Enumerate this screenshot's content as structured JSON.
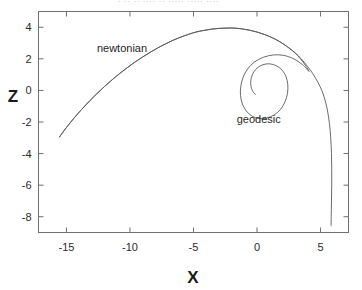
{
  "figure": {
    "top_caption_fragment": "· ·· ·· ···· ·· ····· ····· ····",
    "background_color": "#ffffff",
    "line_color": "#5a5a60",
    "axis_color": "#6f6f74"
  },
  "chart_data": {
    "type": "line",
    "title": "",
    "xlabel": "X",
    "ylabel": "Z",
    "xlim": [
      -17.2,
      7.2
    ],
    "ylim": [
      -9.0,
      5.0
    ],
    "grid": false,
    "legend": "none",
    "xticks": [
      -15,
      -10,
      -5,
      0,
      5
    ],
    "xticklabels": [
      "-15",
      "-10",
      "-5",
      "0",
      "5"
    ],
    "yticks": [
      4,
      2,
      0,
      -2,
      -4,
      -6,
      -8
    ],
    "yticklabels": [
      "4",
      "2",
      "0",
      "-2",
      "-4",
      "-6",
      "-8"
    ],
    "annotations": [
      {
        "text": "newtonian",
        "x": -12.6,
        "y": 2.45
      },
      {
        "text": "geodesic",
        "x": -1.6,
        "y": -2.05
      }
    ],
    "series": [
      {
        "name": "newtonian",
        "label": "newtonian",
        "points": [
          [
            -15.55,
            -2.95
          ],
          [
            -15.0,
            -2.35
          ],
          [
            -14.4,
            -1.75
          ],
          [
            -13.8,
            -1.2
          ],
          [
            -13.2,
            -0.68
          ],
          [
            -12.6,
            -0.2
          ],
          [
            -12.0,
            0.25
          ],
          [
            -11.4,
            0.68
          ],
          [
            -10.8,
            1.08
          ],
          [
            -10.2,
            1.45
          ],
          [
            -9.6,
            1.8
          ],
          [
            -9.0,
            2.12
          ],
          [
            -8.4,
            2.42
          ],
          [
            -7.8,
            2.7
          ],
          [
            -7.2,
            2.95
          ],
          [
            -6.6,
            3.18
          ],
          [
            -6.0,
            3.38
          ],
          [
            -5.4,
            3.55
          ],
          [
            -4.8,
            3.7
          ],
          [
            -4.2,
            3.8
          ],
          [
            -3.6,
            3.88
          ],
          [
            -3.0,
            3.93
          ],
          [
            -2.4,
            3.95
          ],
          [
            -1.8,
            3.95
          ],
          [
            -1.2,
            3.9
          ],
          [
            -0.6,
            3.82
          ],
          [
            0.0,
            3.7
          ],
          [
            0.6,
            3.54
          ],
          [
            1.2,
            3.34
          ],
          [
            1.8,
            3.08
          ],
          [
            2.4,
            2.76
          ],
          [
            3.0,
            2.38
          ],
          [
            3.5,
            1.98
          ],
          [
            4.0,
            1.5
          ],
          [
            4.4,
            1.05
          ],
          [
            4.8,
            0.5
          ],
          [
            5.1,
            0.0
          ],
          [
            5.35,
            -0.6
          ],
          [
            5.55,
            -1.3
          ],
          [
            5.7,
            -2.1
          ],
          [
            5.8,
            -3.0
          ],
          [
            5.86,
            -4.0
          ],
          [
            5.88,
            -5.0
          ],
          [
            5.88,
            -6.0
          ],
          [
            5.86,
            -7.0
          ],
          [
            5.84,
            -8.0
          ],
          [
            5.83,
            -8.55
          ]
        ]
      },
      {
        "name": "geodesic",
        "label": "geodesic",
        "points": [
          [
            -15.55,
            -2.95
          ],
          [
            -15.0,
            -2.35
          ],
          [
            -14.4,
            -1.75
          ],
          [
            -13.8,
            -1.2
          ],
          [
            -13.2,
            -0.68
          ],
          [
            -12.6,
            -0.2
          ],
          [
            -12.0,
            0.25
          ],
          [
            -11.4,
            0.68
          ],
          [
            -10.8,
            1.08
          ],
          [
            -10.2,
            1.45
          ],
          [
            -9.6,
            1.8
          ],
          [
            -9.0,
            2.12
          ],
          [
            -8.4,
            2.42
          ],
          [
            -7.8,
            2.7
          ],
          [
            -7.2,
            2.95
          ],
          [
            -6.6,
            3.18
          ],
          [
            -6.0,
            3.38
          ],
          [
            -5.4,
            3.55
          ],
          [
            -4.8,
            3.7
          ],
          [
            -4.2,
            3.8
          ],
          [
            -3.6,
            3.88
          ],
          [
            -3.0,
            3.93
          ],
          [
            -2.4,
            3.95
          ],
          [
            -1.8,
            3.95
          ],
          [
            -1.2,
            3.9
          ],
          [
            -0.6,
            3.82
          ],
          [
            0.0,
            3.7
          ],
          [
            0.6,
            3.54
          ],
          [
            1.2,
            3.34
          ],
          [
            1.8,
            3.08
          ],
          [
            2.4,
            2.76
          ],
          [
            3.0,
            2.38
          ],
          [
            3.4,
            2.02
          ],
          [
            3.8,
            1.6
          ],
          [
            4.1,
            1.2
          ],
          [
            3.6,
            1.62
          ],
          [
            2.9,
            2.0
          ],
          [
            2.1,
            2.22
          ],
          [
            1.3,
            2.25
          ],
          [
            0.5,
            2.1
          ],
          [
            -0.2,
            1.8
          ],
          [
            -0.75,
            1.35
          ],
          [
            -1.1,
            0.82
          ],
          [
            -1.28,
            0.25
          ],
          [
            -1.3,
            -0.32
          ],
          [
            -1.15,
            -0.85
          ],
          [
            -0.85,
            -1.3
          ],
          [
            -0.4,
            -1.62
          ],
          [
            0.15,
            -1.78
          ],
          [
            0.75,
            -1.75
          ],
          [
            1.35,
            -1.55
          ],
          [
            1.85,
            -1.2
          ],
          [
            2.2,
            -0.72
          ],
          [
            2.4,
            -0.18
          ],
          [
            2.42,
            0.38
          ],
          [
            2.28,
            0.88
          ],
          [
            1.98,
            1.28
          ],
          [
            1.55,
            1.55
          ],
          [
            1.05,
            1.68
          ],
          [
            0.55,
            1.65
          ],
          [
            0.1,
            1.48
          ],
          [
            -0.25,
            1.18
          ],
          [
            -0.45,
            0.8
          ],
          [
            -0.5,
            0.42
          ],
          [
            -0.42,
            0.1
          ],
          [
            -0.28,
            -0.12
          ],
          [
            -0.12,
            -0.25
          ]
        ]
      }
    ]
  }
}
